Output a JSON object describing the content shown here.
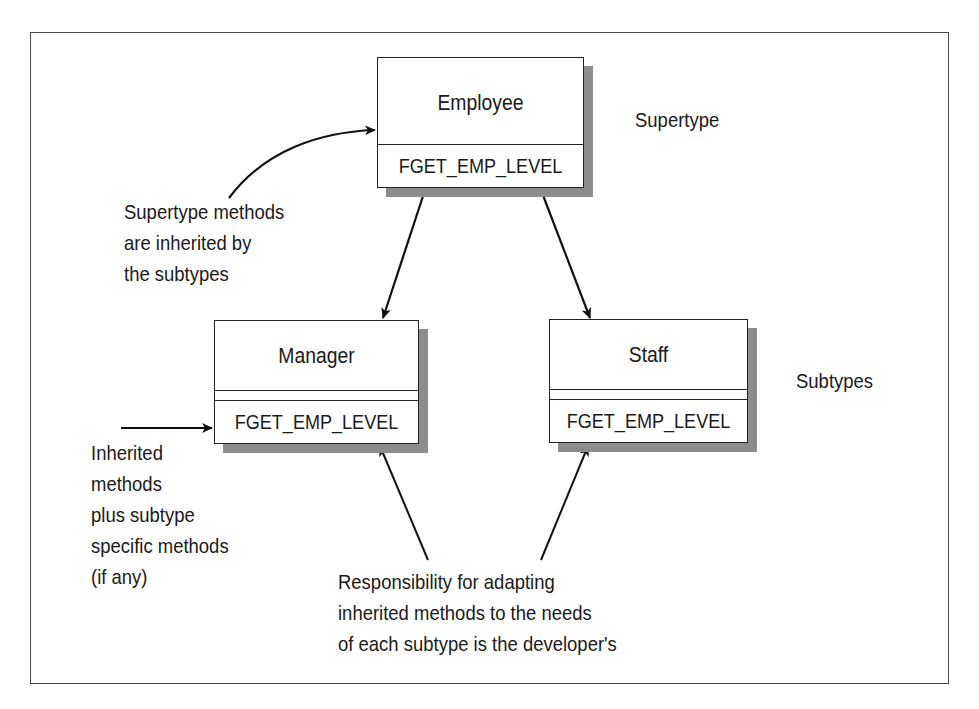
{
  "diagram": {
    "type": "class-inheritance",
    "supertype_label": "Supertype",
    "subtypes_label": "Subtypes",
    "classes": {
      "employee": {
        "name": "Employee",
        "method": "FGET_EMP_LEVEL",
        "role": "supertype"
      },
      "manager": {
        "name": "Manager",
        "method": "FGET_EMP_LEVEL",
        "role": "subtype"
      },
      "staff": {
        "name": "Staff",
        "method": "FGET_EMP_LEVEL",
        "role": "subtype"
      }
    },
    "edges": [
      {
        "from": "employee",
        "to": "manager"
      },
      {
        "from": "employee",
        "to": "staff"
      }
    ],
    "annotations": {
      "supertype_methods": [
        "Supertype methods",
        "are inherited by",
        "the subtypes"
      ],
      "inherited_methods": [
        "Inherited",
        "methods",
        "plus subtype",
        "specific methods",
        "(if any)"
      ],
      "responsibility": [
        "Responsibility for adapting",
        "inherited methods to the needs",
        "of each subtype is the developer's"
      ]
    }
  }
}
